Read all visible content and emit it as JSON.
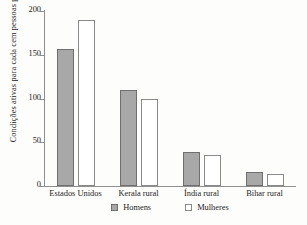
{
  "chart_data": {
    "type": "bar",
    "title": "",
    "xlabel": "",
    "ylabel": "Condições ativas para cada cem pessoas por ano",
    "ylim": [
      0,
      200
    ],
    "yticks": [
      0,
      50,
      100,
      150,
      200
    ],
    "ytick_labels": [
      "0",
      "50",
      "100",
      "150",
      "200"
    ],
    "grid": false,
    "legend_position": "bottom-center",
    "categories": [
      "Estados Unidos",
      "Kerala rural",
      "Índia rural",
      "Bihar rural"
    ],
    "series": [
      {
        "name": "Homens",
        "color": "#a8a8a8",
        "border_color": "#6f6f6f",
        "values": [
          157,
          110,
          39,
          16
        ]
      },
      {
        "name": "Mulheres",
        "color": "#ffffff",
        "border_color": "#8a8a8a",
        "values": [
          190,
          100,
          35,
          14
        ]
      }
    ]
  },
  "legend": {
    "items": [
      {
        "label": "Homens",
        "swatch": "filled-gray-square"
      },
      {
        "label": "Mulheres",
        "swatch": "open-white-square"
      }
    ]
  }
}
